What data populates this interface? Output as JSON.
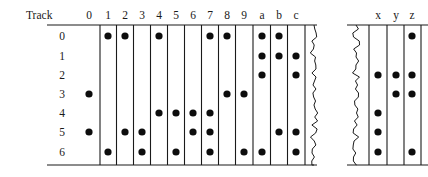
{
  "figure": {
    "row_header_label": "Track",
    "row_labels": [
      "0",
      "1",
      "2",
      "3",
      "4",
      "5",
      "6"
    ],
    "left_panel": {
      "columns": [
        "0",
        "1",
        "2",
        "3",
        "4",
        "5",
        "6",
        "7",
        "8",
        "9",
        "a",
        "b",
        "c"
      ],
      "gridded_columns": [
        "1",
        "2",
        "3",
        "4",
        "5",
        "6",
        "7",
        "8",
        "9",
        "a",
        "b",
        "c"
      ],
      "ungridded_columns": [
        "0"
      ],
      "marks": [
        {
          "row": "0",
          "columns": [
            "1",
            "2",
            "4",
            "7",
            "8",
            "a",
            "b"
          ]
        },
        {
          "row": "1",
          "columns": [
            "a",
            "b",
            "c"
          ]
        },
        {
          "row": "2",
          "columns": [
            "a",
            "c"
          ]
        },
        {
          "row": "3",
          "columns": [
            "0",
            "8",
            "9"
          ]
        },
        {
          "row": "4",
          "columns": [
            "4",
            "5",
            "6",
            "7"
          ]
        },
        {
          "row": "5",
          "columns": [
            "0",
            "2",
            "3",
            "6",
            "7",
            "b",
            "c"
          ]
        },
        {
          "row": "6",
          "columns": [
            "1",
            "3",
            "5",
            "7",
            "9",
            "a",
            "c"
          ]
        }
      ]
    },
    "right_panel": {
      "columns": [
        "x",
        "y",
        "z"
      ],
      "marks": [
        {
          "row": "0",
          "columns": [
            "z"
          ]
        },
        {
          "row": "1",
          "columns": []
        },
        {
          "row": "2",
          "columns": [
            "x",
            "y",
            "z"
          ]
        },
        {
          "row": "3",
          "columns": [
            "y",
            "z"
          ]
        },
        {
          "row": "4",
          "columns": [
            "x"
          ]
        },
        {
          "row": "5",
          "columns": [
            "x"
          ]
        },
        {
          "row": "6",
          "columns": [
            "x",
            "z"
          ]
        }
      ]
    },
    "break_indicators": [
      "left-panel-right-tear",
      "right-panel-left-tear"
    ],
    "colors": {
      "ink": "#1a1a1a",
      "dot": "#0d0d0d",
      "background": "#ffffff"
    },
    "geometry": {
      "row_y": [
        36,
        56,
        75,
        94,
        113,
        132,
        152
      ],
      "left_col_x": [
        89,
        108,
        125,
        142,
        159,
        176,
        193,
        210,
        227,
        244,
        262,
        279,
        296
      ],
      "left_grid_left": 100,
      "left_grid_right": 305,
      "right_col_x": [
        378,
        396,
        412
      ],
      "right_grid_left": 369,
      "right_grid_right": 421,
      "rule_y_top": 25,
      "rule_y_bottom": 165,
      "header_y": 19,
      "dot_radius": 3.6
    }
  }
}
